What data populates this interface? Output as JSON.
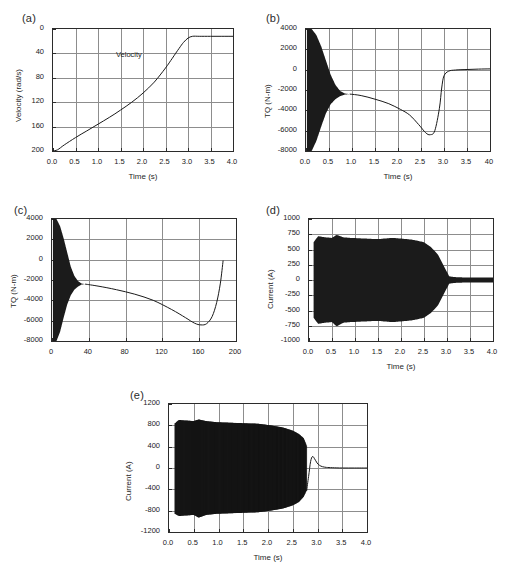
{
  "figure": {
    "panel_labels": {
      "a": "(a)",
      "b": "(b)",
      "c": "(c)",
      "d": "(d)",
      "e": "(e)"
    }
  },
  "chart_data": [
    {
      "panel": "(a)",
      "type": "line",
      "title": "",
      "xlabel": "Time (s)",
      "ylabel": "Velocity (rad/s)",
      "xlim": [
        0.0,
        4.0
      ],
      "ylim": [
        0,
        200
      ],
      "xticks": [
        "0.0",
        "0.5",
        "1.0",
        "1.5",
        "2.0",
        "2.5",
        "3.0",
        "3.5",
        "4.0"
      ],
      "yticks": [
        "0",
        "40",
        "80",
        "120",
        "160",
        "200"
      ],
      "grid": true,
      "legend": null,
      "annotations": [
        {
          "text": "Velocity",
          "x": 2.05,
          "y": 170
        }
      ],
      "series": [
        {
          "name": "Velocity",
          "x": [
            0.0,
            0.1,
            0.25,
            0.5,
            0.75,
            1.0,
            1.25,
            1.5,
            1.75,
            2.0,
            2.25,
            2.5,
            2.65,
            2.8,
            2.9,
            3.0,
            3.1,
            3.25,
            3.5,
            3.75,
            4.0
          ],
          "values": [
            0,
            2,
            10,
            22,
            33,
            44,
            55,
            67,
            80,
            95,
            113,
            136,
            152,
            168,
            178,
            185,
            188,
            188,
            188,
            188,
            188
          ]
        }
      ]
    },
    {
      "panel": "(b)",
      "type": "line",
      "title": "",
      "xlabel": "Time (s)",
      "ylabel": "TQ (N-m)",
      "xlim": [
        0.0,
        4.0
      ],
      "ylim": [
        -8000,
        4000
      ],
      "xticks": [
        "0.0",
        "0.5",
        "1.0",
        "1.5",
        "2.0",
        "2.5",
        "3.0",
        "3.5",
        "40"
      ],
      "yticks": [
        "4000",
        "2000",
        "0",
        "-2000",
        "-4000",
        "-6000",
        "-8000"
      ],
      "grid": true,
      "legend": null,
      "annotations": [],
      "oscillation": {
        "description": "high-frequency torque ripple decaying from full range to mean",
        "start_x": 0.02,
        "end_x": 0.95,
        "upper_envelope": [
          4000,
          4000,
          3400,
          2300,
          900,
          -500,
          -1500,
          -2100,
          -2350,
          -2400
        ],
        "lower_envelope": [
          -8000,
          -8000,
          -7000,
          -5600,
          -4300,
          -3400,
          -2900,
          -2600,
          -2450,
          -2400
        ]
      },
      "series": [
        {
          "name": "TQ mean",
          "x": [
            0.95,
            1.2,
            1.5,
            1.8,
            2.05,
            2.25,
            2.45,
            2.6,
            2.7,
            2.8,
            2.9,
            2.95,
            3.0,
            3.1,
            3.25,
            3.5,
            3.75,
            4.0
          ],
          "values": [
            -2400,
            -2550,
            -2900,
            -3350,
            -3900,
            -4450,
            -5400,
            -6200,
            -6400,
            -6000,
            -3800,
            -1800,
            -600,
            -150,
            -30,
            20,
            60,
            80
          ]
        }
      ]
    },
    {
      "panel": "(c)",
      "type": "line",
      "title": "",
      "xlabel": "",
      "ylabel": "TQ (N-m)",
      "xlim": [
        0,
        200
      ],
      "ylim": [
        -8000,
        4000
      ],
      "xticks": [
        "0",
        "40",
        "80",
        "120",
        "160",
        "200"
      ],
      "yticks": [
        "4000",
        "2000",
        "0",
        "-2000",
        "-4000",
        "-6000",
        "-8000"
      ],
      "grid": true,
      "legend": null,
      "annotations": [],
      "oscillation": {
        "description": "high-frequency torque ripple decaying from full range to mean",
        "start_x": 1,
        "end_x": 36,
        "upper_envelope": [
          4000,
          4000,
          3300,
          2100,
          700,
          -700,
          -1600,
          -2100,
          -2350,
          -2400
        ],
        "lower_envelope": [
          -8000,
          -8000,
          -7100,
          -5700,
          -4400,
          -3500,
          -2950,
          -2650,
          -2450,
          -2400
        ]
      },
      "series": [
        {
          "name": "TQ mean",
          "x": [
            36,
            50,
            70,
            90,
            110,
            130,
            145,
            155,
            162,
            168,
            174,
            179,
            183,
            186
          ],
          "values": [
            -2400,
            -2600,
            -2950,
            -3400,
            -4000,
            -4900,
            -5700,
            -6250,
            -6420,
            -6300,
            -5600,
            -4200,
            -2300,
            -80
          ]
        }
      ]
    },
    {
      "panel": "(d)",
      "type": "line",
      "title": "",
      "xlabel": "Time (s)",
      "ylabel": "Current (A)",
      "xlim": [
        0.0,
        4.0
      ],
      "ylim": [
        -1000,
        1000
      ],
      "xticks": [
        "0.0",
        "0.5",
        "1.0",
        "1.5",
        "2.0",
        "2.5",
        "3.0",
        "3.5",
        "4.0"
      ],
      "yticks": [
        "1000",
        "750",
        "500",
        "250",
        "0",
        "-250",
        "-500",
        "-750",
        "-1000"
      ],
      "grid": true,
      "legend": null,
      "annotations": [],
      "oscillation": {
        "description": "dense current waveform band, near-constant amplitude then collapsing after 2.6 s",
        "start_x": 0.1,
        "end_x": 4.0,
        "envelope_x": [
          0.1,
          0.2,
          0.35,
          0.5,
          0.6,
          0.75,
          0.9,
          1.2,
          1.5,
          1.8,
          2.0,
          2.25,
          2.5,
          2.65,
          2.8,
          2.95,
          3.05,
          3.2,
          3.6,
          4.0
        ],
        "upper_envelope": [
          620,
          720,
          700,
          690,
          740,
          700,
          690,
          680,
          670,
          690,
          680,
          660,
          620,
          540,
          420,
          200,
          60,
          45,
          40,
          40
        ],
        "lower_envelope": [
          -620,
          -720,
          -700,
          -690,
          -760,
          -700,
          -690,
          -680,
          -670,
          -690,
          -680,
          -660,
          -620,
          -540,
          -420,
          -200,
          -60,
          -45,
          -40,
          -40
        ]
      },
      "series": []
    },
    {
      "panel": "(e)",
      "type": "line",
      "title": "",
      "xlabel": "Time (s)",
      "ylabel": "Current (A)",
      "xlim": [
        0.0,
        4.0
      ],
      "ylim": [
        -1200,
        1200
      ],
      "xticks": [
        "0.0",
        "0.5",
        "1.0",
        "1.5",
        "2.0",
        "2.5",
        "3.0",
        "3.5",
        "4.0"
      ],
      "yticks": [
        "1200",
        "800",
        "400",
        "0",
        "-400",
        "-800",
        "-1200"
      ],
      "grid": true,
      "legend": null,
      "annotations": [],
      "oscillation": {
        "description": "current waveform with resolvable cycles, amplitude ~880 A decreasing, ending near 2.75 s",
        "start_x": 0.12,
        "end_x": 2.78,
        "envelope_x": [
          0.12,
          0.2,
          0.35,
          0.5,
          0.6,
          0.75,
          0.95,
          1.2,
          1.5,
          1.8,
          2.05,
          2.3,
          2.5,
          2.62,
          2.72,
          2.78
        ],
        "upper_envelope": [
          840,
          900,
          890,
          880,
          910,
          880,
          860,
          850,
          840,
          830,
          800,
          760,
          700,
          640,
          560,
          420
        ],
        "lower_envelope": [
          -860,
          -900,
          -890,
          -880,
          -930,
          -880,
          -860,
          -850,
          -840,
          -830,
          -800,
          -760,
          -700,
          -640,
          -540,
          -420
        ]
      },
      "series": [
        {
          "name": "settling transient",
          "x": [
            2.78,
            2.82,
            2.86,
            2.9,
            2.94,
            2.99,
            3.04,
            3.1,
            3.18,
            3.3,
            3.5,
            3.75,
            4.0
          ],
          "values": [
            -430,
            -160,
            120,
            215,
            175,
            95,
            50,
            25,
            12,
            5,
            0,
            0,
            0
          ]
        }
      ]
    }
  ]
}
